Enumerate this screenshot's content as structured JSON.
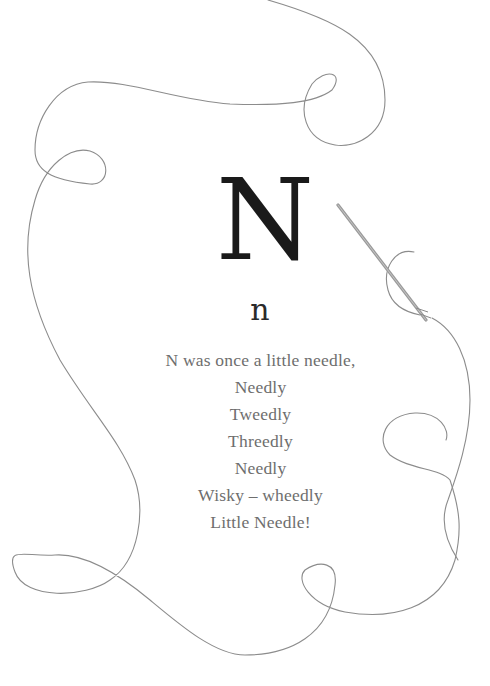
{
  "illustration": {
    "capital_letter": "N",
    "lowercase_letter": "n",
    "poem_lines": [
      "N was once a little needle,",
      "Needly",
      "Tweedly",
      "Threedly",
      "Needly",
      "Wisky – wheedly",
      "Little Needle!"
    ],
    "icons": [
      "needle-icon",
      "thread-decoration"
    ],
    "colors": {
      "background": "#ffffff",
      "thread": "#8a8a8a",
      "needle": "#9a9a9a",
      "capital_letter": "#1a1a1a",
      "poem_text": "#6e6e6e"
    }
  }
}
